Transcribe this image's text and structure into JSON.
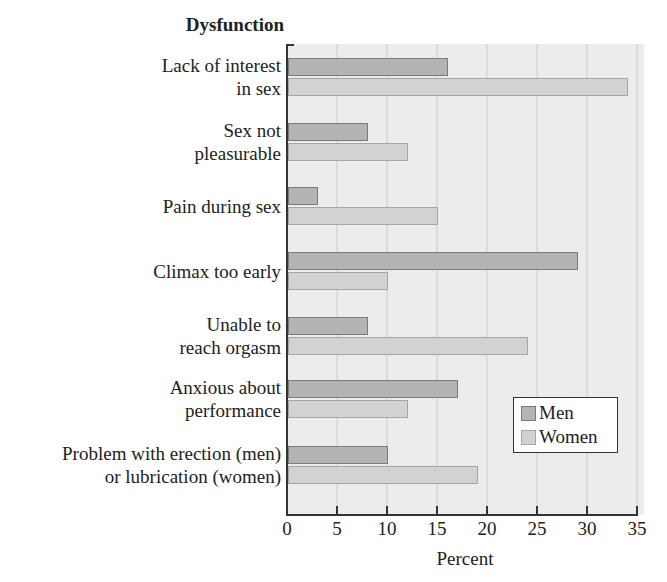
{
  "chart_data": {
    "type": "bar",
    "orientation": "horizontal",
    "title": "Dysfunction",
    "xlabel": "Percent",
    "ylabel": "Dysfunction",
    "xlim": [
      0,
      35
    ],
    "xticks": [
      "0",
      "5",
      "10",
      "15",
      "20",
      "25",
      "30",
      "35"
    ],
    "grid": true,
    "legend_position": "lower right inside",
    "categories": [
      [
        "Lack of interest",
        "in sex"
      ],
      [
        "Sex not",
        "pleasurable"
      ],
      [
        "Pain during sex"
      ],
      [
        "Climax too early"
      ],
      [
        "Unable to",
        "reach orgasm"
      ],
      [
        "Anxious about",
        "performance"
      ],
      [
        "Problem with erection (men)",
        "or lubrication (women)"
      ]
    ],
    "series": [
      {
        "name": "Men",
        "color": "#b4b4b4",
        "values": [
          16,
          8,
          3,
          29,
          8,
          17,
          10
        ]
      },
      {
        "name": "Women",
        "color": "#d2d2d2",
        "values": [
          34,
          12,
          15,
          10,
          24,
          12,
          19
        ]
      }
    ]
  }
}
